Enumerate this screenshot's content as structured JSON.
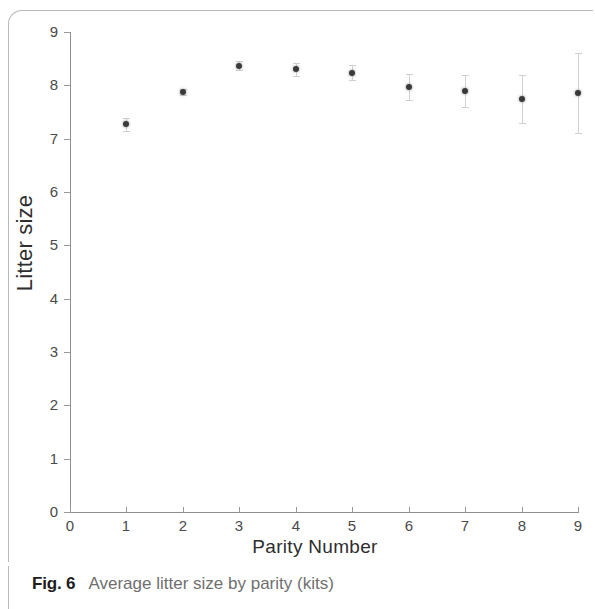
{
  "figure": {
    "caption_label": "Fig. 6",
    "caption_text": "Average litter size by parity (kits)"
  },
  "chart_data": {
    "type": "scatter",
    "title": "",
    "xlabel": "Parity  Number",
    "ylabel": "Litter size",
    "x": [
      1,
      2,
      3,
      4,
      5,
      6,
      7,
      8,
      9
    ],
    "values": [
      7.27,
      7.88,
      8.37,
      8.3,
      8.24,
      7.97,
      7.9,
      7.75,
      7.85
    ],
    "error_low": [
      0.12,
      0.06,
      0.09,
      0.12,
      0.14,
      0.24,
      0.3,
      0.45,
      0.75
    ],
    "error_high": [
      0.12,
      0.06,
      0.09,
      0.12,
      0.14,
      0.24,
      0.3,
      0.45,
      0.75
    ],
    "xlim": [
      0,
      9
    ],
    "ylim": [
      0,
      9
    ],
    "xticks": [
      0,
      1,
      2,
      3,
      4,
      5,
      6,
      7,
      8,
      9
    ],
    "yticks": [
      0,
      1,
      2,
      3,
      4,
      5,
      6,
      7,
      8,
      9
    ],
    "grid": false,
    "legend": "none",
    "marker_color": "#3a3a3a",
    "errorbar_color": "#d2d2d2",
    "axis_color": "#8d8d8d"
  }
}
